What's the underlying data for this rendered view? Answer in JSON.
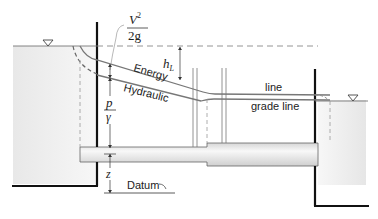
{
  "diagram": {
    "labels": {
      "velocity_head_num": "V",
      "velocity_head_exp": "2",
      "velocity_head_den": "2g",
      "energy_word": "Energy",
      "energy_line_word": "line",
      "hydraulic_word": "Hydraulic",
      "hydraulic_line_word": "grade line",
      "head_loss": "h",
      "head_loss_sub": "L",
      "pressure_head_num": "p",
      "pressure_head_den": "γ",
      "elevation": "z",
      "datum": "Datum"
    },
    "symbols": {
      "free_surface_left": "▽",
      "free_surface_right": "▽"
    },
    "colors": {
      "wall": "#111111",
      "line": "#777777",
      "dash": "#888888",
      "water_light": "#f4f4f4",
      "water_dark": "#e4e4e4",
      "pipe_light": "#f6f6f6",
      "pipe_dark": "#d8d8d8"
    }
  }
}
